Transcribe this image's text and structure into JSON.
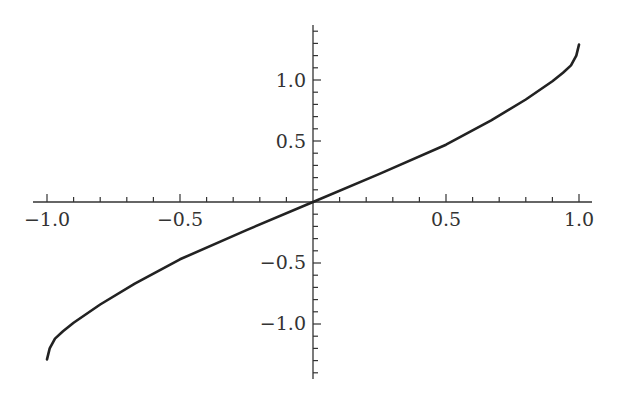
{
  "chart_data": {
    "type": "line",
    "title": "",
    "xlabel": "",
    "ylabel": "",
    "xlim": [
      -1.0,
      1.0
    ],
    "ylim": [
      -1.35,
      1.45
    ],
    "grid": false,
    "legend": null,
    "x_ticks": [
      "-1.0",
      "-0.5",
      "0.5",
      "1.0"
    ],
    "y_ticks": [
      "1.0",
      "0.5",
      "-0.5",
      "-1.0"
    ],
    "series": [
      {
        "name": "curve",
        "color": "#222222",
        "x": [
          -1.0,
          -0.99,
          -0.97,
          -0.94,
          -0.9,
          -0.8,
          -0.67,
          -0.5,
          -0.25,
          0.0,
          0.25,
          0.5,
          0.67,
          0.8,
          0.9,
          0.94,
          0.97,
          0.99,
          1.0
        ],
        "y": [
          -1.29,
          -1.2,
          -1.12,
          -1.06,
          -0.99,
          -0.84,
          -0.67,
          -0.47,
          -0.23,
          0.0,
          0.23,
          0.47,
          0.67,
          0.84,
          0.99,
          1.06,
          1.12,
          1.2,
          1.29
        ]
      }
    ]
  },
  "labels": {
    "x_neg1": "−1.0",
    "x_neg05": "−0.5",
    "x_05": "0.5",
    "x_1": "1.0",
    "y_1": "1.0",
    "y_05": "0.5",
    "y_neg05": "−0.5",
    "y_neg1": "−1.0"
  }
}
